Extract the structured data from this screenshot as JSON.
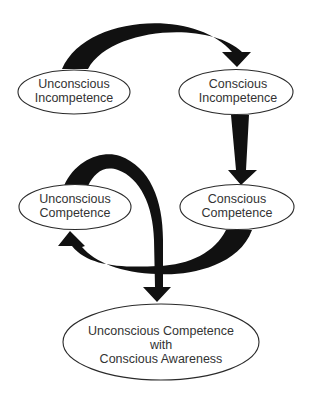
{
  "diagram": {
    "type": "competence-learning-model",
    "background": "#ffffff",
    "arrow_color": "#111111",
    "text_color": "#333333",
    "nodes": [
      {
        "id": "unconscious-incompetence",
        "lines": [
          "Unconscious",
          "Incompetence"
        ]
      },
      {
        "id": "conscious-incompetence",
        "lines": [
          "Conscious",
          "Incompetence"
        ]
      },
      {
        "id": "unconscious-competence",
        "lines": [
          "Unconscious",
          "Competence"
        ]
      },
      {
        "id": "conscious-competence",
        "lines": [
          "Conscious",
          "Competence"
        ]
      },
      {
        "id": "unconscious-competence-with-awareness",
        "lines": [
          "Unconscious Competence",
          "with",
          "Conscious Awareness"
        ]
      }
    ],
    "edges": [
      {
        "from": "unconscious-incompetence",
        "to": "conscious-incompetence"
      },
      {
        "from": "conscious-incompetence",
        "to": "conscious-competence"
      },
      {
        "from": "conscious-competence",
        "to": "unconscious-competence"
      },
      {
        "from": "unconscious-competence",
        "to": "unconscious-competence-with-awareness"
      }
    ]
  }
}
